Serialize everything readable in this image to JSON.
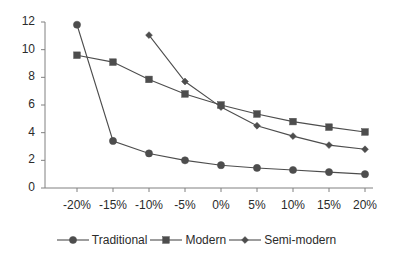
{
  "chart_data": {
    "type": "line",
    "title": "",
    "subtitle": "",
    "xlabel": "",
    "ylabel": "",
    "categories": [
      "-20%",
      "-15%",
      "-10%",
      "-5%",
      "0%",
      "5%",
      "10%",
      "15%",
      "20%"
    ],
    "ylim": [
      0,
      12
    ],
    "yticks": [
      0,
      2,
      4,
      6,
      8,
      10,
      12
    ],
    "ytick_labels": [
      "0",
      "2",
      "4",
      "6",
      "8",
      "10",
      "12"
    ],
    "grid": false,
    "legend_position": "bottom",
    "series": [
      {
        "name": "Traditional",
        "marker": "circle",
        "color": "#4d4d4d",
        "values": [
          11.8,
          3.4,
          2.5,
          2.0,
          1.65,
          1.45,
          1.3,
          1.15,
          1.0
        ]
      },
      {
        "name": "Modern",
        "marker": "square",
        "color": "#4d4d4d",
        "values": [
          9.6,
          9.1,
          7.85,
          6.8,
          6.0,
          5.35,
          4.8,
          4.4,
          4.05
        ]
      },
      {
        "name": "Semi-modern",
        "marker": "diamond",
        "color": "#4d4d4d",
        "values": [
          null,
          null,
          11.05,
          7.7,
          5.85,
          4.5,
          3.75,
          3.1,
          2.8
        ]
      }
    ]
  },
  "axis": {
    "line_color": "#808080",
    "text_color": "#2b2b2b"
  },
  "legend": {
    "items": [
      {
        "label": "Traditional",
        "marker": "circle"
      },
      {
        "label": "Modern",
        "marker": "square"
      },
      {
        "label": "Semi-modern",
        "marker": "diamond"
      }
    ]
  }
}
